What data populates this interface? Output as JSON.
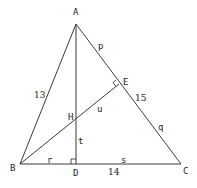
{
  "diagram": {
    "type": "triangle-geometry",
    "points": {
      "A": {
        "label": "A",
        "x": 76,
        "y": 24
      },
      "B": {
        "label": "B",
        "x": 20,
        "y": 164
      },
      "C": {
        "label": "C",
        "x": 181,
        "y": 164
      },
      "D": {
        "label": "D",
        "x": 76,
        "y": 164
      },
      "E": {
        "label": "E",
        "x": 119,
        "y": 84
      },
      "H": {
        "label": "H",
        "x": 76,
        "y": 118
      }
    },
    "segments": [
      {
        "from": "A",
        "to": "B"
      },
      {
        "from": "A",
        "to": "C"
      },
      {
        "from": "B",
        "to": "C"
      },
      {
        "from": "A",
        "to": "D"
      },
      {
        "from": "B",
        "to": "E"
      }
    ],
    "right_angles": [
      "D",
      "E"
    ],
    "side_labels": {
      "AB": "13",
      "AC": "15",
      "BC": "14"
    },
    "segment_variables": {
      "AE": "p",
      "EC": "q",
      "BD": "r",
      "DC": "s",
      "HD": "t",
      "HE": "u"
    },
    "colors": {
      "line": "#3a3a3a",
      "text": "#222222",
      "background": "#ffffff"
    }
  }
}
